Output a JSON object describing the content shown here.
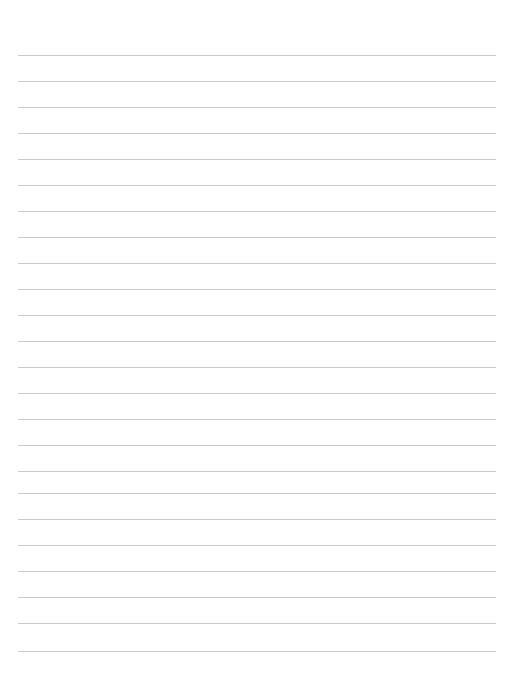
{
  "page": {
    "name": "lined-paper-sheet",
    "width": 514,
    "height": 681,
    "background_color": "#ffffff",
    "orientation": "portrait",
    "content_text": "",
    "is_blank": true
  },
  "ruling": {
    "style": "horizontal-ruled",
    "line_color": "#c9c9ce",
    "line_thickness_px": 1,
    "line_spacing_px": 26,
    "first_line_y": 55,
    "line_left_x": 18,
    "line_right_x": 496,
    "line_width_px": 478,
    "line_count": 24,
    "top_margin_px": 55,
    "bottom_margin_px": 30,
    "has_vertical_margin_rule": false,
    "line_y_positions": [
      55,
      81,
      107,
      133,
      159,
      185,
      211,
      237,
      237,
      263,
      289,
      315,
      341,
      367,
      393,
      419,
      445,
      471,
      497,
      519,
      545,
      571,
      597,
      623,
      651
    ],
    "lines": [
      {
        "index": 1,
        "y": 55
      },
      {
        "index": 2,
        "y": 81
      },
      {
        "index": 3,
        "y": 107
      },
      {
        "index": 4,
        "y": 133
      },
      {
        "index": 5,
        "y": 159
      },
      {
        "index": 6,
        "y": 185
      },
      {
        "index": 7,
        "y": 211
      },
      {
        "index": 8,
        "y": 237
      },
      {
        "index": 9,
        "y": 263
      },
      {
        "index": 10,
        "y": 289
      },
      {
        "index": 11,
        "y": 315
      },
      {
        "index": 12,
        "y": 341
      },
      {
        "index": 13,
        "y": 367
      },
      {
        "index": 14,
        "y": 393
      },
      {
        "index": 15,
        "y": 419
      },
      {
        "index": 16,
        "y": 445
      },
      {
        "index": 17,
        "y": 471
      },
      {
        "index": 18,
        "y": 493
      },
      {
        "index": 19,
        "y": 519
      },
      {
        "index": 20,
        "y": 545
      },
      {
        "index": 21,
        "y": 571
      },
      {
        "index": 22,
        "y": 597
      },
      {
        "index": 23,
        "y": 623
      },
      {
        "index": 24,
        "y": 651
      }
    ]
  },
  "written_content": []
}
